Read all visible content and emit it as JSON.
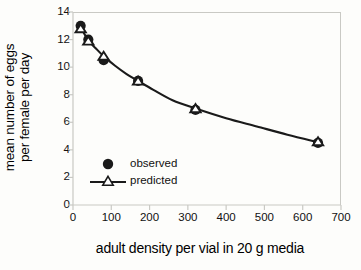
{
  "chart_data": {
    "type": "scatter",
    "title": "",
    "xlabel": "adult density per vial in 20 g media",
    "ylabel_line1": "mean number of eggs",
    "ylabel_line2": "per female per day",
    "xlim": [
      0,
      700
    ],
    "ylim": [
      0,
      14
    ],
    "xticks": [
      0,
      100,
      200,
      300,
      400,
      500,
      600,
      700
    ],
    "yticks": [
      0,
      2,
      4,
      6,
      8,
      10,
      12,
      14
    ],
    "xtick_labels": [
      "0",
      "100",
      "200",
      "300",
      "400",
      "500",
      "600",
      "700"
    ],
    "ytick_labels": [
      "0",
      "2",
      "4",
      "6",
      "8",
      "10",
      "12",
      "14"
    ],
    "grid": false,
    "legend_position": "inside-lower-left",
    "x": [
      20,
      40,
      80,
      170,
      320,
      640
    ],
    "series": [
      {
        "name": "observed",
        "marker": "filled-circle",
        "color": "#1a1a1a",
        "values": [
          13.0,
          12.0,
          10.5,
          9.0,
          6.9,
          4.5
        ]
      },
      {
        "name": "predicted",
        "marker": "open-triangle",
        "color": "#1a1a1a",
        "values": [
          12.8,
          11.9,
          10.8,
          9.0,
          7.0,
          4.6
        ]
      }
    ],
    "curve": [
      [
        20,
        12.9
      ],
      [
        40,
        11.95
      ],
      [
        60,
        11.35
      ],
      [
        80,
        10.8
      ],
      [
        110,
        10.1
      ],
      [
        140,
        9.5
      ],
      [
        170,
        9.0
      ],
      [
        210,
        8.35
      ],
      [
        260,
        7.6
      ],
      [
        320,
        7.0
      ],
      [
        400,
        6.3
      ],
      [
        480,
        5.7
      ],
      [
        560,
        5.1
      ],
      [
        640,
        4.55
      ]
    ]
  },
  "legend": {
    "items": [
      {
        "label": "observed"
      },
      {
        "label": "predicted"
      }
    ]
  },
  "colors": {
    "ink": "#1a1a1a",
    "frame": "#c9c9c4",
    "background": "#fdfdfb"
  }
}
